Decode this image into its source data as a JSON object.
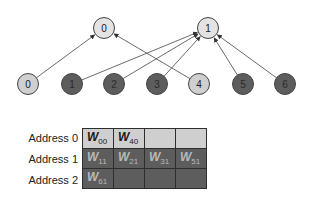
{
  "diagram": {
    "colors": {
      "light": "#cfcfcf",
      "dark": "#5d5d5d",
      "edge": "#6b6b6b",
      "node_border": "#444444"
    },
    "output_nodes": [
      {
        "id": "out-0",
        "label": "0",
        "cx": 104,
        "cy": 28,
        "shade": "light"
      },
      {
        "id": "out-1",
        "label": "1",
        "cx": 208,
        "cy": 28,
        "shade": "light"
      }
    ],
    "input_nodes": [
      {
        "id": "in-0",
        "label": "0",
        "cx": 28,
        "cy": 84,
        "shade": "light"
      },
      {
        "id": "in-1",
        "label": "1",
        "cx": 72,
        "cy": 84,
        "shade": "dark"
      },
      {
        "id": "in-2",
        "label": "2",
        "cx": 114,
        "cy": 84,
        "shade": "dark"
      },
      {
        "id": "in-3",
        "label": "3",
        "cx": 157,
        "cy": 84,
        "shade": "dark"
      },
      {
        "id": "in-4",
        "label": "4",
        "cx": 199,
        "cy": 84,
        "shade": "light"
      },
      {
        "id": "in-5",
        "label": "5",
        "cx": 243,
        "cy": 84,
        "shade": "dark"
      },
      {
        "id": "in-6",
        "label": "6",
        "cx": 285,
        "cy": 84,
        "shade": "dark"
      }
    ],
    "edges": [
      {
        "from": "in-0",
        "to": "out-0"
      },
      {
        "from": "in-4",
        "to": "out-0"
      },
      {
        "from": "in-1",
        "to": "out-1"
      },
      {
        "from": "in-2",
        "to": "out-1"
      },
      {
        "from": "in-3",
        "to": "out-1"
      },
      {
        "from": "in-5",
        "to": "out-1"
      },
      {
        "from": "in-6",
        "to": "out-1"
      }
    ]
  },
  "memory_table": {
    "rows": [
      {
        "label": "Address 0",
        "shade": "light",
        "cells": [
          {
            "w": "W",
            "sub": "00"
          },
          {
            "w": "W",
            "sub": "40"
          },
          {
            "w": "",
            "sub": ""
          },
          {
            "w": "",
            "sub": ""
          }
        ]
      },
      {
        "label": "Address 1",
        "shade": "dark",
        "cells": [
          {
            "w": "W",
            "sub": "11"
          },
          {
            "w": "W",
            "sub": "21"
          },
          {
            "w": "W",
            "sub": "31"
          },
          {
            "w": "W",
            "sub": "51"
          }
        ]
      },
      {
        "label": "Address 2",
        "shade": "dark",
        "cells": [
          {
            "w": "W",
            "sub": "61"
          },
          {
            "w": "",
            "sub": ""
          },
          {
            "w": "",
            "sub": ""
          },
          {
            "w": "",
            "sub": ""
          }
        ]
      }
    ]
  }
}
